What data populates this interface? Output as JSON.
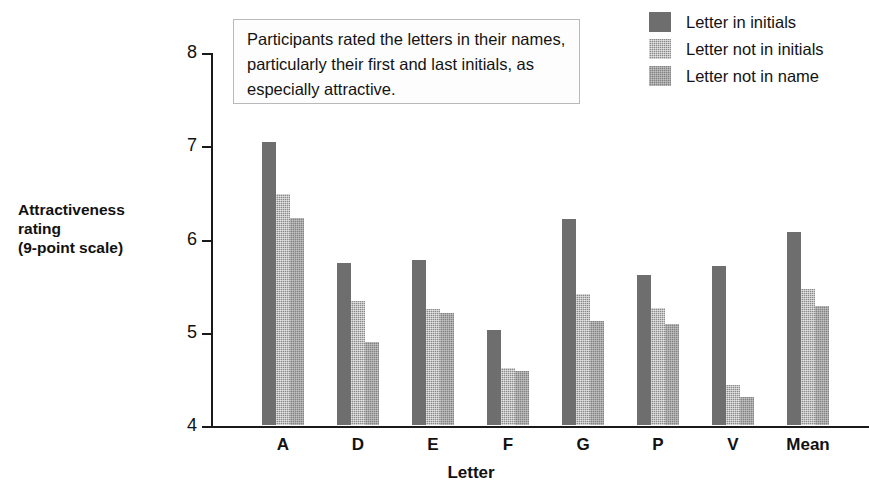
{
  "chart_data": {
    "type": "bar",
    "title": "",
    "xlabel": "Letter",
    "ylabel": "Attractiveness rating (9-point scale)",
    "ylim": [
      4,
      8
    ],
    "yticks": [
      8,
      7,
      6,
      5,
      4
    ],
    "grid": false,
    "legend_position": "top-right",
    "categories": [
      "A",
      "D",
      "E",
      "F",
      "G",
      "P",
      "V",
      "Mean"
    ],
    "series": [
      {
        "name": "Letter in initials",
        "values": [
          7.03,
          5.74,
          5.77,
          5.02,
          6.21,
          5.61,
          5.7,
          6.07
        ]
      },
      {
        "name": "Letter not in initials",
        "values": [
          6.48,
          5.33,
          5.24,
          4.61,
          5.4,
          5.25,
          4.43,
          5.46
        ]
      },
      {
        "name": "Letter not in name",
        "values": [
          6.22,
          4.89,
          5.2,
          4.58,
          5.12,
          5.08,
          4.3,
          5.28
        ]
      }
    ],
    "annotations": [
      "Participants rated the letters in their names, particularly their first and last initials, as especially attractive."
    ]
  },
  "axes": {
    "y_title_lines": [
      "Attractiveness",
      "rating",
      "(9-point scale)"
    ],
    "x_title": "Letter",
    "y_tick_labels": [
      "8",
      "7",
      "6",
      "5",
      "4"
    ],
    "x_tick_labels": [
      "A",
      "D",
      "E",
      "F",
      "G",
      "P",
      "V",
      "Mean"
    ]
  },
  "callout": {
    "text": "Participants rated the letters in their names, particularly their first and last initials, as especially attractive."
  },
  "legend": {
    "items": [
      {
        "label": "Letter in initials",
        "swatch": "series-0-swatch",
        "color": "#6e6e6e"
      },
      {
        "label": "Letter not in initials",
        "swatch": "series-1-swatch",
        "color": "#8a8a8a"
      },
      {
        "label": "Letter not in name",
        "swatch": "series-2-swatch",
        "color": "#838383"
      }
    ]
  }
}
